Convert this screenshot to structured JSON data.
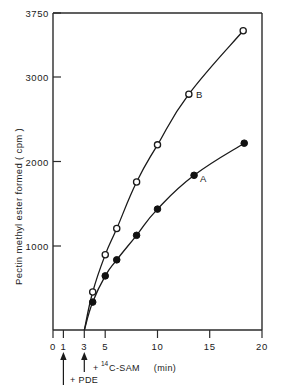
{
  "chart_data": {
    "type": "line",
    "title": "",
    "xlabel": "(min)",
    "ylabel": "Pectin methyl ester formed  ( cpm )",
    "xlim": [
      0,
      20
    ],
    "ylim": [
      0,
      3750
    ],
    "grid": false,
    "legend_position": "inline-point-labels",
    "x_ticks": [
      0,
      1,
      3,
      5,
      10,
      15,
      20
    ],
    "x_tick_labels": [
      "0",
      "1",
      "3",
      "5",
      "10",
      "15",
      "20"
    ],
    "y_ticks": [
      1000,
      2000,
      3000,
      3750
    ],
    "y_tick_labels": [
      "1000",
      "2000",
      "3000",
      "3750"
    ],
    "series": [
      {
        "name": "B",
        "marker": "open-circle",
        "label": "B",
        "x": [
          3,
          3.8,
          5,
          6.1,
          8,
          10,
          13,
          18.2
        ],
        "values": [
          0,
          450,
          890,
          1200,
          1750,
          2190,
          2790,
          3540
        ]
      },
      {
        "name": "A",
        "marker": "filled-circle",
        "label": "A",
        "x": [
          3,
          3.8,
          5,
          6.1,
          8,
          10,
          13.5,
          18.3
        ],
        "values": [
          0,
          330,
          640,
          830,
          1120,
          1430,
          1830,
          2210
        ]
      }
    ],
    "annotations": [
      {
        "id": "pde",
        "text": "+ PDE",
        "x": 1,
        "arrow": true
      },
      {
        "id": "sam",
        "text_prefix": "+ ",
        "text_sup": "14",
        "text_main": "C-SAM",
        "x": 3,
        "arrow": true
      }
    ],
    "axis_unit_note": "(min)"
  },
  "labels": {
    "y_axis_title": "Pectin methyl ester formed  ( cpm )",
    "x_axis_unit": "(min)",
    "series_b": "B",
    "series_a": "A",
    "annot_pde": "+ PDE",
    "annot_sam_prefix": "+",
    "annot_sam_sup": "14",
    "annot_sam_main": "C-SAM",
    "tick_y_3750": "3750",
    "tick_y_3000": "3000",
    "tick_y_2000": "2000",
    "tick_y_1000": "1000",
    "tick_x_0": "0",
    "tick_x_1": "1",
    "tick_x_3": "3",
    "tick_x_5": "5",
    "tick_x_10": "10",
    "tick_x_15": "15",
    "tick_x_20": "20"
  },
  "colors": {
    "ink": "#1a1a1a",
    "background": "#ffffff"
  }
}
